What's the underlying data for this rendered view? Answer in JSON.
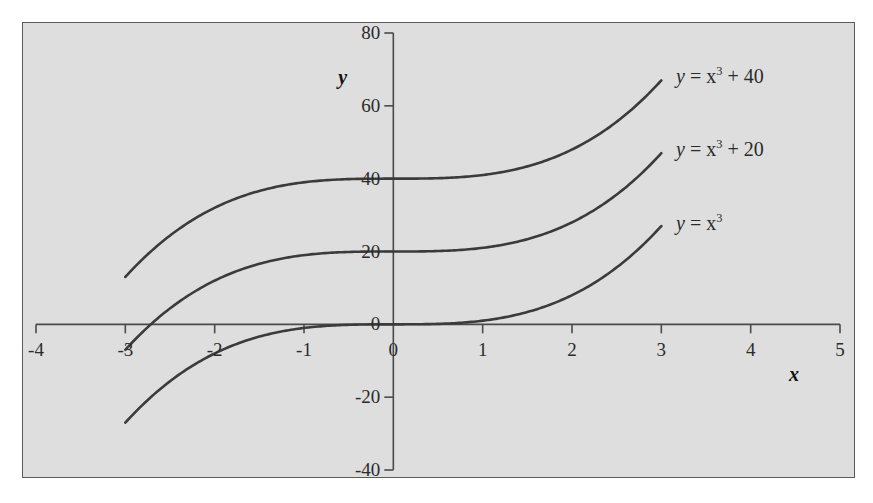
{
  "chart_data": {
    "type": "line",
    "title": "",
    "xlabel": "x",
    "ylabel": "y",
    "xlim": [
      -4,
      5
    ],
    "ylim": [
      -40,
      80
    ],
    "grid": false,
    "legend_position": "right-inline",
    "x_ticks": [
      "-4",
      "-3",
      "-2",
      "-1",
      "0",
      "1",
      "2",
      "3",
      "4",
      "5"
    ],
    "x_tick_values": [
      -4,
      -3,
      -2,
      -1,
      0,
      1,
      2,
      3,
      4,
      5
    ],
    "y_ticks": [
      "80",
      "60",
      "40",
      "20",
      "0",
      "-20",
      "-40"
    ],
    "y_tick_values": [
      80,
      60,
      40,
      20,
      0,
      -20,
      -40
    ],
    "x_domain_drawn": [
      -3,
      3
    ],
    "series": [
      {
        "name": "y = x^3 + 40",
        "label_html": "<span class=\"var\">y</span> = x<sup>3</sup> + 40",
        "offset": 40,
        "color": "#3b3b3b",
        "x": [
          -3,
          -2.5,
          -2,
          -1.5,
          -1,
          -0.5,
          0,
          0.5,
          1,
          1.5,
          2,
          2.5,
          3
        ],
        "values": [
          13,
          24.4,
          32,
          36.6,
          39,
          39.9,
          40,
          40.1,
          41,
          43.4,
          48,
          55.6,
          67
        ]
      },
      {
        "name": "y = x^3 + 20",
        "label_html": "<span class=\"var\">y</span> = x<sup>3</sup> + 20",
        "offset": 20,
        "color": "#3b3b3b",
        "x": [
          -3,
          -2.5,
          -2,
          -1.5,
          -1,
          -0.5,
          0,
          0.5,
          1,
          1.5,
          2,
          2.5,
          3
        ],
        "values": [
          -7,
          4.4,
          12,
          16.6,
          19,
          19.9,
          20,
          20.1,
          21,
          23.4,
          28,
          35.6,
          47
        ]
      },
      {
        "name": "y = x^3",
        "label_html": "<span class=\"var\">y</span> = x<sup>3</sup>",
        "offset": 0,
        "color": "#3b3b3b",
        "x": [
          -3,
          -2.5,
          -2,
          -1.5,
          -1,
          -0.5,
          0,
          0.5,
          1,
          1.5,
          2,
          2.5,
          3
        ],
        "values": [
          -27,
          -15.6,
          -8,
          -3.4,
          -1,
          -0.1,
          0,
          0.1,
          1,
          3.4,
          8,
          15.6,
          27
        ]
      }
    ]
  },
  "axes": {
    "x_label": "x",
    "y_label": "y",
    "x_tick_labels": [
      "-4",
      "-3",
      "-2",
      "-1",
      "0",
      "1",
      "2",
      "3",
      "4",
      "5"
    ],
    "y_tick_labels": [
      "80",
      "60",
      "40",
      "20",
      "0",
      "-20",
      "-40"
    ]
  },
  "curve_labels": [
    "y = x3 + 40",
    "y = x3 + 20",
    "y = x3"
  ],
  "colors": {
    "panel_background": "#dedede",
    "panel_border": "#5a5a5a",
    "axis": "#4a4a4a",
    "curve": "#3b3b3b",
    "text": "#2b2b2b",
    "page_background": "#ffffff"
  }
}
